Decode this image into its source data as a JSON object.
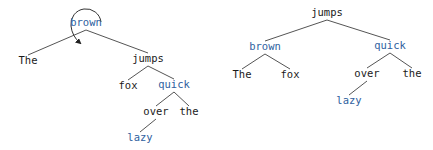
{
  "colors": {
    "default_text": "#1a1a1a",
    "highlight_text": "#2f5fa0",
    "edge": "#555555"
  },
  "trees": [
    {
      "name": "before-rotation",
      "rotation_marker": {
        "node": "brown",
        "icon": "rotation-arrow-icon"
      },
      "nodes": [
        {
          "id": "l_brown",
          "label": "brown",
          "x": 86,
          "y": 23,
          "highlight": true
        },
        {
          "id": "l_The",
          "label": "The",
          "x": 28,
          "y": 61,
          "highlight": false
        },
        {
          "id": "l_jumps",
          "label": "jumps",
          "x": 148,
          "y": 59,
          "highlight": false
        },
        {
          "id": "l_fox",
          "label": "fox",
          "x": 128,
          "y": 86,
          "highlight": false
        },
        {
          "id": "l_quick",
          "label": "quick",
          "x": 174,
          "y": 85,
          "highlight": true
        },
        {
          "id": "l_over",
          "label": "over",
          "x": 156,
          "y": 112,
          "highlight": false
        },
        {
          "id": "l_the",
          "label": "the",
          "x": 189,
          "y": 112,
          "highlight": false
        },
        {
          "id": "l_lazy",
          "label": "lazy",
          "x": 140,
          "y": 138,
          "highlight": true
        }
      ],
      "edges": [
        [
          "l_brown",
          "l_The"
        ],
        [
          "l_brown",
          "l_jumps"
        ],
        [
          "l_jumps",
          "l_fox"
        ],
        [
          "l_jumps",
          "l_quick"
        ],
        [
          "l_quick",
          "l_over"
        ],
        [
          "l_quick",
          "l_the"
        ],
        [
          "l_over",
          "l_lazy"
        ]
      ]
    },
    {
      "name": "after-rotation",
      "nodes": [
        {
          "id": "r_jumps",
          "label": "jumps",
          "x": 327,
          "y": 13,
          "highlight": false
        },
        {
          "id": "r_brown",
          "label": "brown",
          "x": 265,
          "y": 47,
          "highlight": true
        },
        {
          "id": "r_quick",
          "label": "quick",
          "x": 390,
          "y": 46,
          "highlight": true
        },
        {
          "id": "r_The",
          "label": "The",
          "x": 242,
          "y": 75,
          "highlight": false
        },
        {
          "id": "r_fox",
          "label": "fox",
          "x": 290,
          "y": 75,
          "highlight": false
        },
        {
          "id": "r_over",
          "label": "over",
          "x": 367,
          "y": 74,
          "highlight": false
        },
        {
          "id": "r_the",
          "label": "the",
          "x": 412,
          "y": 74,
          "highlight": false
        },
        {
          "id": "r_lazy",
          "label": "lazy",
          "x": 349,
          "y": 101,
          "highlight": true
        }
      ],
      "edges": [
        [
          "r_jumps",
          "r_brown"
        ],
        [
          "r_jumps",
          "r_quick"
        ],
        [
          "r_brown",
          "r_The"
        ],
        [
          "r_brown",
          "r_fox"
        ],
        [
          "r_quick",
          "r_over"
        ],
        [
          "r_quick",
          "r_the"
        ],
        [
          "r_over",
          "r_lazy"
        ]
      ]
    }
  ]
}
